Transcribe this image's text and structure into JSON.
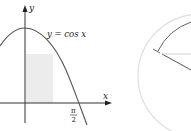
{
  "figure": {
    "left_panel": {
      "curve_label": "y = cos x",
      "y_axis_label": "y",
      "x_axis_label": "x",
      "tick_label_numerator": "π",
      "tick_label_denominator": "2",
      "colors": {
        "curve": "#555555",
        "axis": "#333333",
        "shaded_region": "#ebebeb"
      }
    },
    "right_panel": {
      "colors": {
        "outer_arc": "#666666",
        "inner_circle": "#dddddd",
        "radius_line_dark": "#555555",
        "radius_line_light": "#cccccc"
      }
    }
  }
}
